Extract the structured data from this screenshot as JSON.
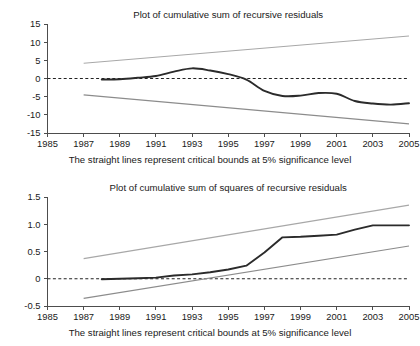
{
  "chart_data": [
    {
      "type": "line",
      "id": "cusum",
      "title": "Plot of cumulative sum of recursive residuals",
      "caption": "The straight lines represent critical bounds at 5% significance level",
      "xlabel": "",
      "ylabel": "",
      "xlim": [
        1985,
        2005
      ],
      "ylim": [
        -15,
        15
      ],
      "grid": false,
      "legend": "none",
      "xticks": [
        1985,
        1987,
        1989,
        1991,
        1993,
        1995,
        1997,
        1999,
        2001,
        2003,
        2005
      ],
      "xtick_labels": [
        "1985",
        "1987",
        "1989",
        "1991",
        "1993",
        "1995",
        "1997",
        "1999",
        "2001",
        "2003",
        "2005"
      ],
      "yticks": [
        15,
        10,
        5,
        0,
        -5,
        -10,
        -15
      ],
      "ytick_labels": [
        "15",
        "10",
        "5",
        "0",
        "-5",
        "-10",
        "-15"
      ],
      "zero_line": 0,
      "colors": {
        "series": "#2b2b2b",
        "upper_bound": "#a8a8a8",
        "lower_bound": "#8c8c8c",
        "zero": "#222222",
        "axis": "#4d4d4d"
      },
      "series": [
        {
          "name": "CUSUM",
          "style": "solid-dark",
          "x": [
            1988,
            1989,
            1990,
            1991,
            1992,
            1993,
            1994,
            1995,
            1996,
            1997,
            1998,
            1999,
            2000,
            2001,
            2002,
            2003,
            2004,
            2005
          ],
          "values": [
            -0.3,
            -0.2,
            0.2,
            0.7,
            1.9,
            2.8,
            2.2,
            1.2,
            -0.3,
            -3.4,
            -4.8,
            -4.7,
            -4.0,
            -4.2,
            -6.2,
            -6.9,
            -7.2,
            -6.8
          ]
        },
        {
          "name": "Upper critical bound (5%)",
          "style": "solid-light",
          "x": [
            1987,
            2005
          ],
          "values": [
            4.2,
            11.7
          ]
        },
        {
          "name": "Lower critical bound (5%)",
          "style": "solid-light",
          "x": [
            1987,
            2005
          ],
          "values": [
            -4.5,
            -12.5
          ]
        }
      ]
    },
    {
      "type": "line",
      "id": "cusumsq",
      "title": "Plot of cumulative sum of squares of recursive residuals",
      "caption": "The straight lines represent critical bounds at 5% significance level",
      "xlabel": "",
      "ylabel": "",
      "xlim": [
        1985,
        2005
      ],
      "ylim": [
        -0.5,
        1.5
      ],
      "grid": false,
      "legend": "none",
      "xticks": [
        1985,
        1987,
        1989,
        1991,
        1993,
        1995,
        1997,
        1999,
        2001,
        2003,
        2005
      ],
      "xtick_labels": [
        "1985",
        "1987",
        "1989",
        "1991",
        "1993",
        "1995",
        "1997",
        "1999",
        "2001",
        "2003",
        "2005"
      ],
      "yticks": [
        1.5,
        1.0,
        0.5,
        0,
        -0.5
      ],
      "ytick_labels": [
        "1.5",
        "1.0",
        "0.5",
        "0",
        "-0.5"
      ],
      "zero_line": 0,
      "colors": {
        "series": "#2b2b2b",
        "upper_bound": "#a8a8a8",
        "lower_bound": "#8c8c8c",
        "zero": "#222222",
        "axis": "#4d4d4d"
      },
      "series": [
        {
          "name": "CUSUM of squares",
          "style": "solid-dark",
          "x": [
            1988,
            1989,
            1990,
            1991,
            1992,
            1993,
            1994,
            1995,
            1996,
            1997,
            1998,
            1999,
            2000,
            2001,
            2002,
            2003,
            2004,
            2005
          ],
          "values": [
            -0.01,
            0.0,
            0.01,
            0.02,
            0.06,
            0.08,
            0.12,
            0.17,
            0.24,
            0.48,
            0.76,
            0.77,
            0.79,
            0.81,
            0.9,
            0.98,
            0.98,
            0.98
          ]
        },
        {
          "name": "Upper critical bound (5%)",
          "style": "solid-light",
          "x": [
            1987,
            2005
          ],
          "values": [
            0.37,
            1.35
          ]
        },
        {
          "name": "Lower critical bound (5%)",
          "style": "solid-light",
          "x": [
            1987,
            2005
          ],
          "values": [
            -0.36,
            0.6
          ]
        }
      ]
    }
  ]
}
